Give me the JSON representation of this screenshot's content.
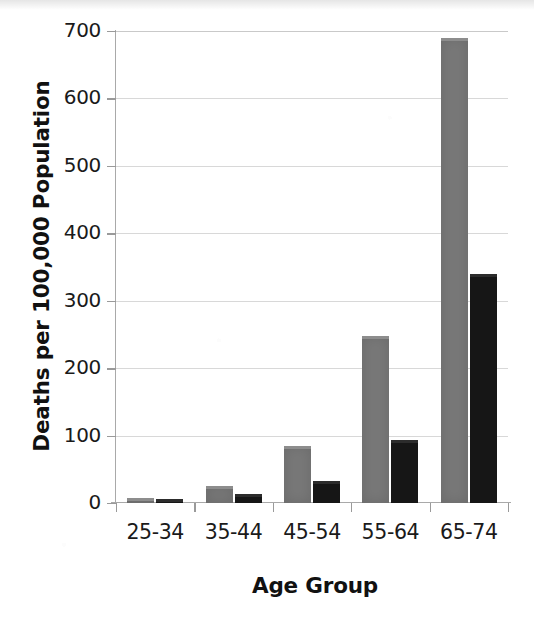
{
  "chart_data": {
    "type": "bar",
    "title": "",
    "subtitle": "",
    "xlabel": "Age Group",
    "ylabel": "Deaths per 100,000 Population",
    "categories": [
      "25-34",
      "35-44",
      "45-54",
      "55-64",
      "65-74"
    ],
    "series": [
      {
        "name": "series-1",
        "color": "#787878",
        "values": [
          8,
          25,
          85,
          247,
          690
        ]
      },
      {
        "name": "series-2",
        "color": "#161616",
        "values": [
          6,
          14,
          33,
          93,
          340
        ]
      }
    ],
    "ylim": [
      0,
      700
    ],
    "yticks": [
      0,
      100,
      200,
      300,
      400,
      500,
      600,
      700
    ],
    "ytick_labels": [
      "0",
      "100",
      "200",
      "300",
      "400",
      "500",
      "600",
      "700"
    ],
    "grid": true,
    "grid_axis": "y",
    "legend": false,
    "legend_position": "none",
    "bar_style": "3d-offset",
    "background": "#ffffff"
  }
}
